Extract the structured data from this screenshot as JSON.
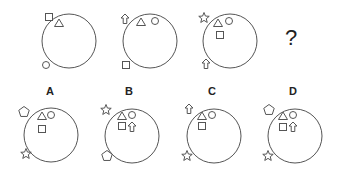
{
  "puzzle": {
    "question_mark": "?",
    "stroke_color": "#555555",
    "sequence": [
      {
        "id": "panel-1",
        "cx": 69,
        "cy": 41,
        "r": 27,
        "shapes": [
          {
            "type": "square",
            "x": 49,
            "y": 17,
            "inside": false
          },
          {
            "type": "triangle",
            "x": 59,
            "y": 23,
            "inside": true
          },
          {
            "type": "circle",
            "x": 46,
            "y": 65,
            "inside": false
          }
        ]
      },
      {
        "id": "panel-2",
        "cx": 150,
        "cy": 41,
        "r": 27,
        "shapes": [
          {
            "type": "arrow-up",
            "x": 125,
            "y": 19,
            "inside": false
          },
          {
            "type": "triangle",
            "x": 141,
            "y": 22,
            "inside": true
          },
          {
            "type": "circle",
            "x": 155,
            "y": 21,
            "inside": true
          },
          {
            "type": "square",
            "x": 126,
            "y": 65,
            "inside": false
          }
        ]
      },
      {
        "id": "panel-3",
        "cx": 230,
        "cy": 41,
        "r": 27,
        "shapes": [
          {
            "type": "star",
            "x": 204,
            "y": 18,
            "inside": false
          },
          {
            "type": "triangle",
            "x": 218,
            "y": 23,
            "inside": true
          },
          {
            "type": "circle",
            "x": 229,
            "y": 21,
            "inside": true
          },
          {
            "type": "square",
            "x": 220,
            "y": 35,
            "inside": true
          },
          {
            "type": "arrow-up",
            "x": 206,
            "y": 64,
            "inside": false
          }
        ]
      }
    ],
    "question": {
      "x": 291,
      "y": 38
    },
    "options": [
      {
        "label": "A",
        "label_x": 50,
        "label_y": 85,
        "cx": 51,
        "cy": 135,
        "r": 27,
        "shapes": [
          {
            "type": "pentagon",
            "x": 24,
            "y": 112
          },
          {
            "type": "triangle",
            "x": 42,
            "y": 116
          },
          {
            "type": "circle",
            "x": 51,
            "y": 115
          },
          {
            "type": "square",
            "x": 42,
            "y": 129
          },
          {
            "type": "star",
            "x": 26,
            "y": 154
          }
        ]
      },
      {
        "label": "B",
        "label_x": 129,
        "label_y": 85,
        "cx": 132,
        "cy": 136,
        "r": 27,
        "shapes": [
          {
            "type": "star",
            "x": 106,
            "y": 110
          },
          {
            "type": "triangle",
            "x": 122,
            "y": 116
          },
          {
            "type": "circle",
            "x": 132,
            "y": 115
          },
          {
            "type": "square",
            "x": 122,
            "y": 126
          },
          {
            "type": "arrow-up",
            "x": 132,
            "y": 127
          },
          {
            "type": "pentagon",
            "x": 107,
            "y": 156
          }
        ]
      },
      {
        "label": "C",
        "label_x": 212,
        "label_y": 85,
        "cx": 214,
        "cy": 136,
        "r": 27,
        "shapes": [
          {
            "type": "arrow-up",
            "x": 189,
            "y": 109
          },
          {
            "type": "triangle",
            "x": 202,
            "y": 116
          },
          {
            "type": "circle",
            "x": 212,
            "y": 115
          },
          {
            "type": "square",
            "x": 202,
            "y": 126
          },
          {
            "type": "star",
            "x": 187,
            "y": 156
          }
        ]
      },
      {
        "label": "D",
        "label_x": 293,
        "label_y": 85,
        "cx": 295,
        "cy": 136,
        "r": 27,
        "shapes": [
          {
            "type": "pentagon",
            "x": 269,
            "y": 110
          },
          {
            "type": "triangle",
            "x": 283,
            "y": 116
          },
          {
            "type": "circle",
            "x": 293,
            "y": 115
          },
          {
            "type": "square",
            "x": 283,
            "y": 127
          },
          {
            "type": "arrow-up",
            "x": 293,
            "y": 127
          },
          {
            "type": "star",
            "x": 268,
            "y": 156
          }
        ]
      }
    ]
  }
}
